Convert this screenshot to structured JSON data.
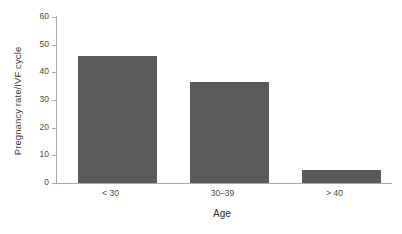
{
  "chart_data": {
    "type": "bar",
    "title": "",
    "xlabel": "Age",
    "ylabel": "Pregnancy rate/IVF cycle",
    "categories": [
      "< 30",
      "30–39",
      "> 40"
    ],
    "values": [
      46,
      36.5,
      4.7
    ],
    "series": [
      {
        "name": "Pregnancy rate/IVF cycle",
        "values": [
          46,
          36.5,
          4.7
        ]
      }
    ],
    "ylim": [
      0,
      60
    ],
    "yticks": [
      0,
      10,
      20,
      30,
      40,
      50,
      60
    ],
    "ytick_labels": [
      "0",
      "10",
      "20",
      "30",
      "40",
      "50",
      "60"
    ],
    "grid": false,
    "legend": false,
    "bar_color": "#5a5a5a",
    "axis_color": "#a9a9a9",
    "background": "#ffffff"
  }
}
